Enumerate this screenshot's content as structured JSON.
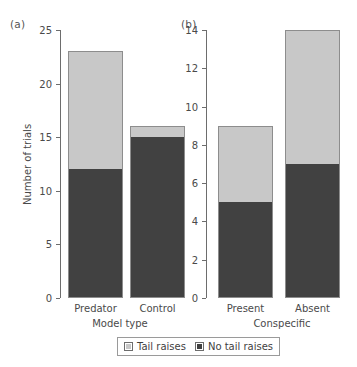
{
  "figure": {
    "panels": [
      {
        "tag": "(a)",
        "xlabel": "Model type",
        "ylabel": "Number of trials",
        "yticks": [
          "0",
          "5",
          "10",
          "15",
          "20",
          "25"
        ],
        "categories": [
          "Predator",
          "Control"
        ]
      },
      {
        "tag": "(b)",
        "xlabel": "Conspecific",
        "ylabel": "",
        "yticks": [
          "0",
          "2",
          "4",
          "6",
          "8",
          "10",
          "12",
          "14"
        ],
        "categories": [
          "Present",
          "Absent"
        ]
      }
    ]
  },
  "legend": {
    "entries": [
      {
        "label": "Tail raises",
        "color": "#c8c8c8"
      },
      {
        "label": "No tail raises",
        "color": "#414141"
      }
    ]
  },
  "colors": {
    "light": "#c8c8c8",
    "dark": "#414141",
    "axis": "#6d6d6d",
    "background": "#ffffff"
  },
  "chart_data": [
    {
      "type": "bar",
      "stacked": true,
      "panel": "(a)",
      "title": "",
      "xlabel": "Model type",
      "ylabel": "Number of trials",
      "categories": [
        "Predator",
        "Control"
      ],
      "series": [
        {
          "name": "No tail raises",
          "values": [
            12,
            15
          ],
          "color": "#414141"
        },
        {
          "name": "Tail raises",
          "values": [
            11,
            1
          ],
          "color": "#c8c8c8"
        }
      ],
      "totals": [
        23,
        16
      ],
      "ylim": [
        0,
        25
      ],
      "yticks": [
        0,
        5,
        10,
        15,
        20,
        25
      ],
      "grid": false,
      "legend_position": "bottom"
    },
    {
      "type": "bar",
      "stacked": true,
      "panel": "(b)",
      "title": "",
      "xlabel": "Conspecific",
      "ylabel": "",
      "categories": [
        "Present",
        "Absent"
      ],
      "series": [
        {
          "name": "No tail raises",
          "values": [
            5,
            7
          ],
          "color": "#414141"
        },
        {
          "name": "Tail raises",
          "values": [
            4,
            7
          ],
          "color": "#c8c8c8"
        }
      ],
      "totals": [
        9,
        14
      ],
      "ylim": [
        0,
        14
      ],
      "yticks": [
        0,
        2,
        4,
        6,
        8,
        10,
        12,
        14
      ],
      "grid": false,
      "legend_position": "bottom"
    }
  ]
}
